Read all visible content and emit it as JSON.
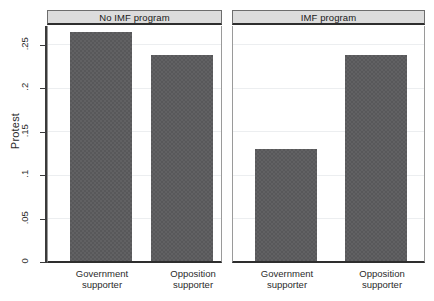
{
  "chart_data": {
    "type": "bar",
    "title": "",
    "xlabel": "",
    "ylabel": "Protest",
    "ylim": [
      0,
      0.272
    ],
    "grid": true,
    "legend": null,
    "yticks": [
      0,
      0.05,
      0.1,
      0.15,
      0.2,
      0.25
    ],
    "ytick_labels": [
      "0",
      ".05",
      ".1",
      ".15",
      ".2",
      ".25"
    ],
    "categories": [
      "Government supporter",
      "Opposition supporter"
    ],
    "panels": [
      {
        "title": "No IMF program",
        "categories": [
          "Government supporter",
          "Opposition supporter"
        ],
        "values": [
          0.264,
          0.238
        ]
      },
      {
        "title": "IMF program",
        "categories": [
          "Government supporter",
          "Opposition supporter"
        ],
        "values": [
          0.129,
          0.237
        ]
      }
    ],
    "bar_color": "#58585a",
    "panel_title_bg": "#dcdcdc",
    "axis_color": "#3a3a3a",
    "gridline_color": "#eceef0"
  },
  "axis": {
    "y_title": "Protest",
    "tick_0": "0",
    "tick_05": ".05",
    "tick_1": ".1",
    "tick_15": ".15",
    "tick_2": ".2",
    "tick_25": ".25"
  },
  "panel_left": {
    "title": "No IMF program",
    "cat1_line1": "Government",
    "cat1_line2": "supporter",
    "cat2_line1": "Opposition",
    "cat2_line2": "supporter"
  },
  "panel_right": {
    "title": "IMF program",
    "cat1_line1": "Government",
    "cat1_line2": "supporter",
    "cat2_line1": "Opposition",
    "cat2_line2": "supporter"
  }
}
